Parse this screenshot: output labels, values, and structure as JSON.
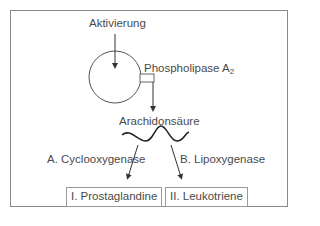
{
  "diagram": {
    "activation_label": "Aktivierung",
    "enzyme_label": "Phospholipase A",
    "enzyme_subscript": "2",
    "substrate_label": "Arachidonsäure",
    "pathway_a_label": "A. Cyclooxygenase",
    "pathway_b_label": "B. Lipoxygenase",
    "product_1_label": "I. Prostaglandine",
    "product_2_label": "II. Leukotriene"
  },
  "colors": {
    "line": "#333333",
    "frame": "#8a8a8a",
    "text": "#4a4a4a"
  }
}
